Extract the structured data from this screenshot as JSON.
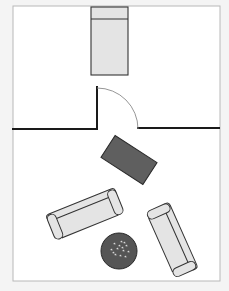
{
  "canvas": {
    "width": 229,
    "height": 291,
    "background": "#f4f4f4"
  },
  "room": {
    "x": 13,
    "y": 6,
    "width": 207,
    "height": 275,
    "fill": "#ffffff",
    "stroke": "#b8b8b8"
  },
  "colors": {
    "wall": "#1a1a1a",
    "furniture_fill": "#e4e4e4",
    "furniture_stroke": "#333333",
    "table_fill": "#5f5f5f",
    "rug_fill": "#555555",
    "rug_pattern": "#dcdcdc",
    "door_arc": "#8a8a8a"
  },
  "bed": {
    "x": 91,
    "y": 7,
    "width": 37,
    "height": 68,
    "headboard_y": 19
  },
  "walls": {
    "left": {
      "x1": 13,
      "y1": 129,
      "x2": 97,
      "y2": 129
    },
    "jamb": {
      "x1": 97,
      "y1": 87,
      "x2": 97,
      "y2": 129
    },
    "right": {
      "x1": 138,
      "y1": 128,
      "x2": 219,
      "y2": 128
    }
  },
  "door": {
    "cx": 97,
    "cy": 129,
    "r": 41
  },
  "table": {
    "cx": 129,
    "cy": 160,
    "width": 50,
    "height": 26,
    "rotation": 33
  },
  "sofas": [
    {
      "id": "left-sofa",
      "cx": 85,
      "cy": 214,
      "width": 74,
      "height": 27,
      "rotation": -22
    },
    {
      "id": "right-sofa",
      "cx": 172,
      "cy": 240,
      "width": 72,
      "height": 25,
      "rotation": 66
    }
  ],
  "rug": {
    "cx": 119,
    "cy": 251,
    "r": 18
  }
}
